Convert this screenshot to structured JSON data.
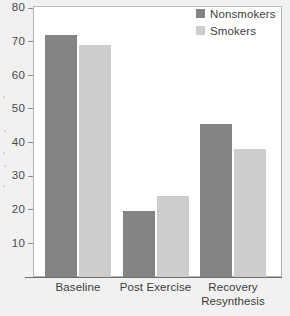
{
  "chart_data": {
    "type": "bar",
    "title": "",
    "subtitle": "",
    "xlabel": "",
    "ylabel": "",
    "categories": [
      "Baseline",
      "Post Exercise",
      "Recovery Resynthesis"
    ],
    "category_lines": [
      [
        "Baseline"
      ],
      [
        "Post Exercise"
      ],
      [
        "Recovery",
        "Resynthesis"
      ]
    ],
    "series": [
      {
        "name": "Nonsmokers",
        "color": "#848484",
        "values": [
          72,
          19.5,
          45.5
        ]
      },
      {
        "name": "Smokers",
        "color": "#cdcdcd",
        "values": [
          69,
          24,
          38
        ]
      }
    ],
    "ylim": [
      0,
      80
    ],
    "yticks": [
      10,
      20,
      30,
      40,
      50,
      60,
      70,
      80
    ],
    "ytick_labels": [
      "10",
      "20",
      "30",
      "40",
      "50",
      "60",
      "70",
      "80"
    ],
    "grid": false,
    "legend_position": "top-right",
    "annotations": []
  },
  "legend": {
    "items": [
      {
        "label": "Nonsmokers"
      },
      {
        "label": "Smokers"
      }
    ]
  },
  "colors": {
    "background": "#f1f1f1",
    "plot_background": "#ffffff",
    "axis": "#6e6e6e",
    "text": "#3d3d3d",
    "series_nonsmokers": "#848484",
    "series_smokers": "#cdcdcd"
  }
}
